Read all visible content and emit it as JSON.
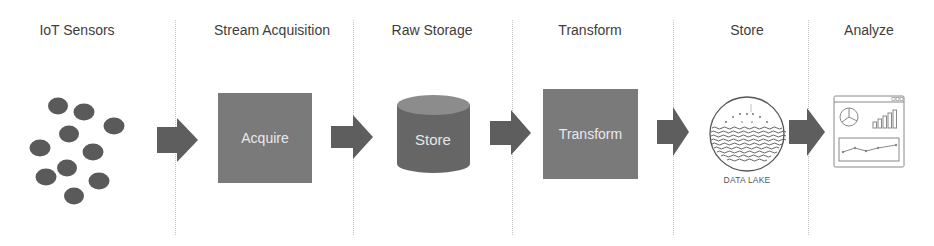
{
  "stages": [
    {
      "title": "IoT Sensors",
      "center_x": 77
    },
    {
      "title": "Stream Acquisition",
      "center_x": 265
    },
    {
      "title": "Raw Storage",
      "center_x": 433
    },
    {
      "title": "Transform",
      "center_x": 592
    },
    {
      "title": "Store",
      "center_x": 747
    },
    {
      "title": "Analyze",
      "center_x": 869
    }
  ],
  "nodes": {
    "acquire": {
      "label": "Acquire",
      "color": "#7a7a7a"
    },
    "raw_store": {
      "label": "Store",
      "color": "#666666"
    },
    "transform": {
      "label": "Transform",
      "color": "#7a7a7a"
    },
    "data_lake": {
      "label": "DATA LAKE"
    },
    "dashboard": {
      "label": "Dashboard"
    }
  },
  "colors": {
    "arrow": "#5e5e5e",
    "sensor_dot": "#5a5a5a",
    "divider": "#c4c4c4"
  },
  "flow": [
    "IoT Sensors",
    "Acquire",
    "Store",
    "Transform",
    "DATA LAKE",
    "Analyze"
  ]
}
